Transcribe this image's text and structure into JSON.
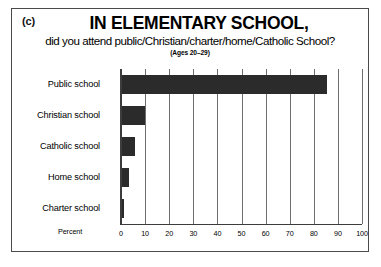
{
  "figure": {
    "panel_letter": "(c)",
    "title": "IN ELEMENTARY SCHOOL,",
    "subtitle": "did you attend public/Christian/charter/home/Catholic School?",
    "age_note": "(Ages 20–29)"
  },
  "chart_data": {
    "type": "bar",
    "orientation": "horizontal",
    "title": "IN ELEMENTARY SCHOOL,",
    "subtitle": "did you attend public/Christian/charter/home/Catholic School?",
    "annotation": "(Ages 20–29)",
    "xlabel": "Percent",
    "ylabel": "",
    "categories": [
      "Public school",
      "Christian school",
      "Catholic school",
      "Home school",
      "Charter school"
    ],
    "values": [
      85,
      9.5,
      5.5,
      3,
      1
    ],
    "xlim": [
      0,
      100
    ],
    "xticks": [
      0,
      10,
      20,
      30,
      40,
      50,
      60,
      70,
      80,
      90,
      100
    ],
    "xtick_labels": [
      "0",
      "10",
      "20",
      "30",
      "40",
      "50",
      "60",
      "70",
      "80",
      "90",
      "100"
    ],
    "grid": true,
    "legend": false,
    "bar_color": "#2b2b2b",
    "axis_color": "#3c3c3c",
    "gridline_color": "#6e6e6e",
    "background": "#ffffff"
  }
}
